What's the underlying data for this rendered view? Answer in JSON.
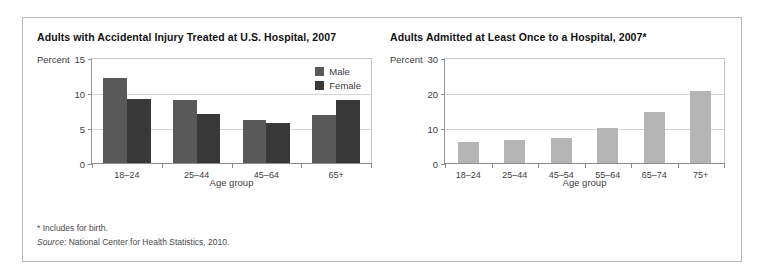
{
  "figure": {
    "footnote": "* Includes for birth.",
    "source_prefix": "Source:",
    "source_text": "National Center for Health Statistics, 2010."
  },
  "colors": {
    "male_bar": "#595959",
    "female_bar": "#383838",
    "single_bar": "#b5b5b5",
    "gridline": "#d5d5d5",
    "axis": "#8d8d8d",
    "frame": "#b9b9b9"
  },
  "chart_data": [
    {
      "type": "bar",
      "id": "accidental-injury",
      "title": "Adults with Accidental Injury Treated at U.S. Hospital, 2007",
      "xlabel": "Age group",
      "ylabel": "Percent",
      "ylim": [
        0,
        15
      ],
      "yticks": [
        0,
        5,
        10,
        15
      ],
      "grid": true,
      "legend_position": "top-right",
      "categories": [
        "18–24",
        "25–44",
        "45–64",
        "65+"
      ],
      "series": [
        {
          "name": "Male",
          "color": "#595959",
          "values": [
            12.3,
            9.2,
            6.3,
            7.0
          ]
        },
        {
          "name": "Female",
          "color": "#383838",
          "values": [
            9.3,
            7.1,
            5.8,
            9.2
          ]
        }
      ]
    },
    {
      "type": "bar",
      "id": "admitted-once",
      "title": "Adults Admitted at Least Once to a Hospital, 2007*",
      "xlabel": "Age group",
      "ylabel": "Percent",
      "ylim": [
        0,
        30
      ],
      "yticks": [
        0,
        10,
        20,
        30
      ],
      "grid": true,
      "legend_position": "none",
      "categories": [
        "18–24",
        "25–44",
        "45–54",
        "55–64",
        "65–74",
        "75+"
      ],
      "series": [
        {
          "name": "All adults",
          "color": "#b5b5b5",
          "values": [
            6.3,
            7.0,
            7.5,
            10.2,
            15.0,
            21.0
          ]
        }
      ]
    }
  ]
}
